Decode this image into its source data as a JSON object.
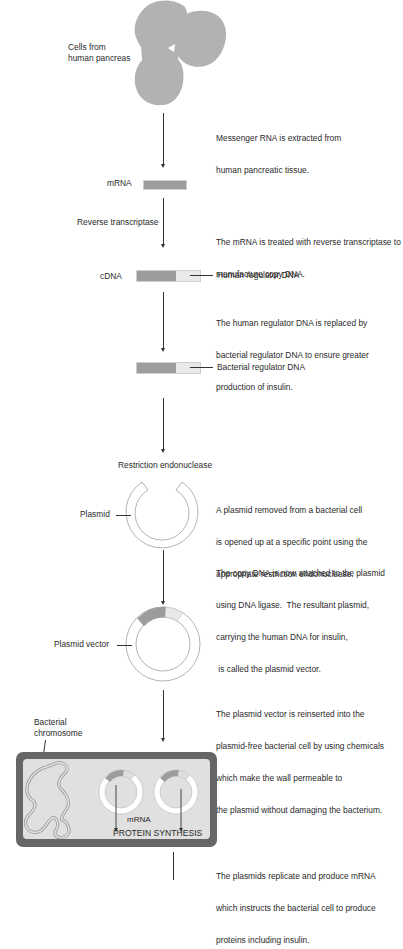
{
  "diagram": {
    "colors": {
      "cell_fill": "#b2b2b2",
      "dna_dark": "#9c9c9c",
      "dna_light": "#e9e9e9",
      "bacterium_wall": "#666666",
      "bacterium_fill": "#e0e0e0",
      "line": "#333333"
    },
    "labels": {
      "cells": "Cells from\nhuman pancreas",
      "cells_line1": "Cells from",
      "cells_line2": "human pancreas",
      "mrna": "mRNA",
      "reverse_transcriptase": "Reverse transcriptase",
      "cdna": "cDNA",
      "human_regulator": "Human regulator DNA",
      "bacterial_regulator": "Bacterial regulator DNA",
      "restriction_endonuclease": "Restriction endonuclease",
      "plasmid": "Plasmid",
      "plasmid_vector": "Plasmid vector",
      "bacterial_chromosome_line1": "Bacterial",
      "bacterial_chromosome_line2": "chromosome",
      "inner_mrna": "mRNA",
      "protein_synthesis": "PROTEIN SYNTHESIS"
    },
    "steps": [
      {
        "id": "extract",
        "lines": [
          "Messenger RNA is extracted from",
          "human pancreatic tissue."
        ]
      },
      {
        "id": "reverse",
        "lines": [
          "The mRNA is treated with reverse transcriptase to",
          "manufacture copy DNA."
        ]
      },
      {
        "id": "replace",
        "lines": [
          "The human regulator DNA is replaced by",
          "bacterial regulator DNA to ensure greater",
          "production of insulin."
        ]
      },
      {
        "id": "open",
        "lines": [
          "A plasmid removed from a bacterial cell",
          "is opened up at a specific point using the",
          "appropriate restriction endonuclease."
        ]
      },
      {
        "id": "ligate",
        "lines": [
          "The copy DNA is now attached to the plasmid",
          "using DNA ligase.  The resultant plasmid,",
          "carrying the human DNA for insulin,",
          " is called the plasmid vector."
        ]
      },
      {
        "id": "reinsert",
        "lines": [
          "The plasmid vector is reinserted into the",
          "plasmid-free bacterial cell by using chemicals",
          "which make the wall permeable to",
          "the plasmid without damaging the bacterium."
        ]
      },
      {
        "id": "replicate",
        "lines": [
          "The plasmids replicate and produce mRNA",
          "which instructs the bacterial cell to produce",
          "proteins including insulin."
        ]
      }
    ]
  }
}
